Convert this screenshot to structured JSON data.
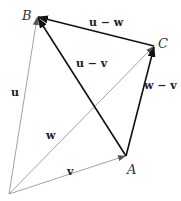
{
  "diagram": {
    "points": {
      "O": {
        "x": 9,
        "y": 194
      },
      "A": {
        "x": 126,
        "y": 156,
        "label": "A"
      },
      "B": {
        "x": 37,
        "y": 17,
        "label": "B"
      },
      "C": {
        "x": 154,
        "y": 46,
        "label": "C"
      }
    },
    "vectors": [
      {
        "id": "u",
        "label": "u",
        "from": "O",
        "to": "B",
        "style": "thin"
      },
      {
        "id": "w",
        "label": "w",
        "from": "O",
        "to": "C",
        "style": "thin"
      },
      {
        "id": "v",
        "label": "v",
        "from": "O",
        "to": "A",
        "style": "thin"
      },
      {
        "id": "u-w",
        "label": "u − w",
        "from": "C",
        "to": "B",
        "style": "thick"
      },
      {
        "id": "u-v",
        "label": "u − v",
        "from": "A",
        "to": "B",
        "style": "thick"
      },
      {
        "id": "w-v",
        "label": "w − v",
        "from": "A",
        "to": "C",
        "style": "thick"
      }
    ],
    "colors": {
      "thin": "#8a8a8a",
      "thick": "#111111"
    }
  }
}
